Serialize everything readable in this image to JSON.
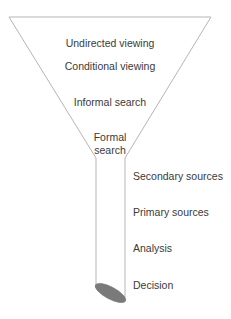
{
  "diagram": {
    "type": "funnel",
    "colors": {
      "outline": "#b5b5b5",
      "fill": "#ffffff",
      "ellipse_fill": "#7a7a7a",
      "text": "#3a3a3a"
    },
    "funnel_stages": [
      {
        "label": "Undirected viewing"
      },
      {
        "label": "Conditional viewing"
      },
      {
        "label": "Informal search"
      },
      {
        "label": "Formal",
        "label_line2": "search"
      }
    ],
    "tube_stages": [
      {
        "label": "Secondary sources"
      },
      {
        "label": "Primary sources"
      },
      {
        "label": "Analysis"
      },
      {
        "label": "Decision"
      }
    ]
  }
}
